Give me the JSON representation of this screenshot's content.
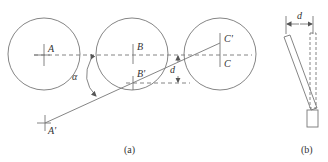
{
  "figure_a": {
    "caption": "(a)",
    "labels": {
      "A": "A",
      "B": "B",
      "C": "C",
      "A_prime": "A'",
      "B_prime": "B'",
      "C_prime": "C'",
      "alpha": "α",
      "d": "d"
    }
  },
  "figure_b": {
    "caption": "(b)",
    "labels": {
      "d": "d"
    }
  },
  "colors": {
    "stroke": "#777777",
    "text": "#333333"
  }
}
